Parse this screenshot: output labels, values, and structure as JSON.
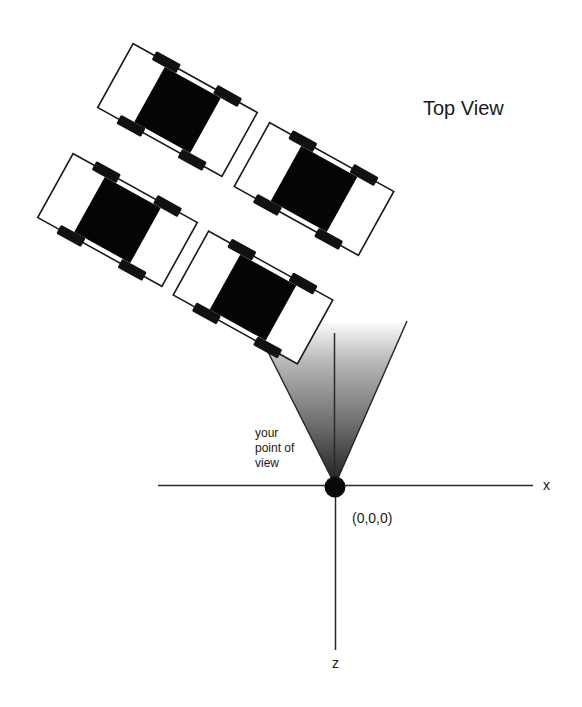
{
  "diagram": {
    "title": "Top View",
    "viewpoint_label": [
      "your",
      "point of",
      "view"
    ],
    "origin_label": "(0,0,0)",
    "axes": {
      "x_label": "x",
      "z_label": "z"
    },
    "cars": [
      {
        "id": "car-1",
        "cx": 177.5,
        "cy": 110,
        "angle": 29
      },
      {
        "id": "car-2",
        "cx": 314,
        "cy": 189,
        "angle": 29
      },
      {
        "id": "car-3",
        "cx": 117.5,
        "cy": 220,
        "angle": 29
      },
      {
        "id": "car-4",
        "cx": 253,
        "cy": 297.5,
        "angle": 29
      }
    ],
    "colors": {
      "cone_dark": "#1e1e1e",
      "cone_light": "#ffffff",
      "ink": "#1a1a1a",
      "background": "#ffffff"
    }
  }
}
